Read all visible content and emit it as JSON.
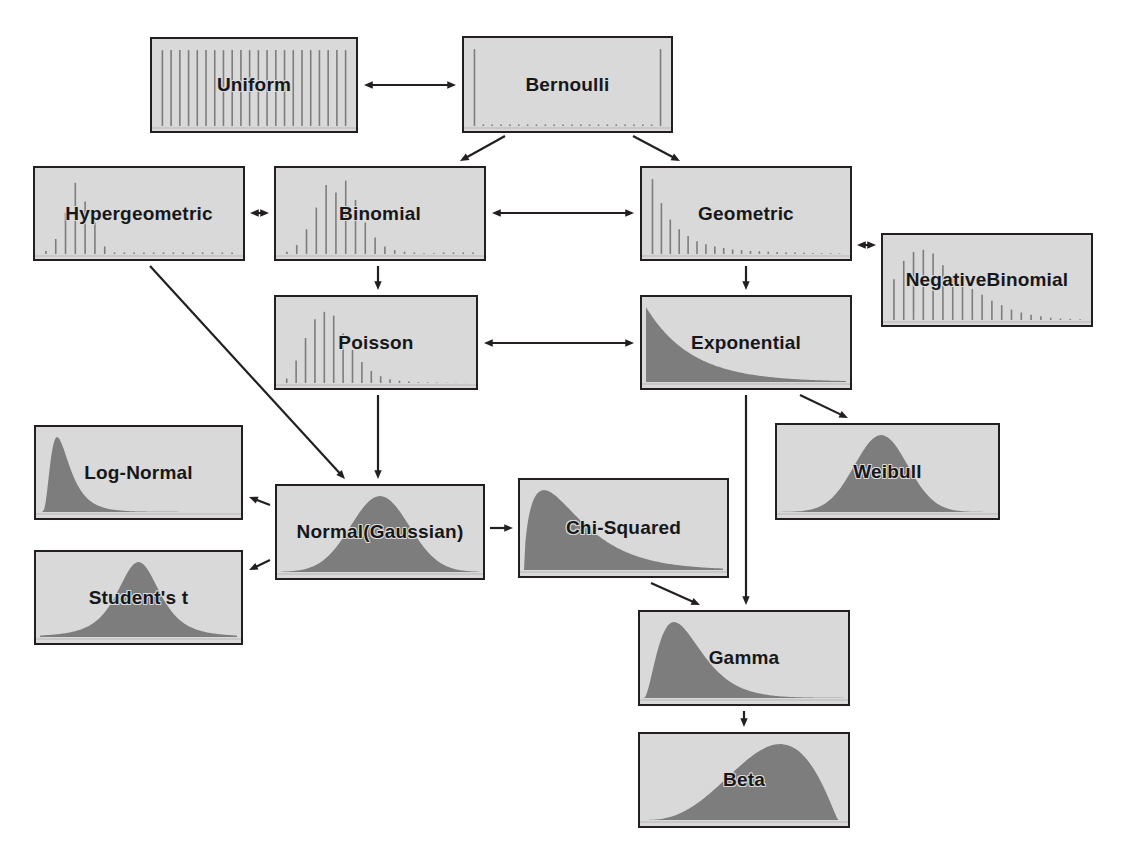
{
  "diagram": {
    "background_color": "#ffffff",
    "box_fill_color": "#d9d9d9",
    "box_border_color": "#231f20",
    "plot_fill_color": "#7d7d7d",
    "label_color": "#17171a"
  },
  "nodes": [
    {
      "id": "uniform",
      "label": "Uniform",
      "label_line2": "",
      "thumb": "discrete-uniform-pmf",
      "x": 150,
      "y": 37,
      "w": 208,
      "h": 96
    },
    {
      "id": "bernoulli",
      "label": "Bernoulli",
      "label_line2": "",
      "thumb": "bernoulli-pmf",
      "x": 462,
      "y": 36,
      "w": 211,
      "h": 97
    },
    {
      "id": "hypergeometric",
      "label": "Hypergeometric",
      "label_line2": "",
      "thumb": "hypergeometric-pmf",
      "x": 33,
      "y": 166,
      "w": 212,
      "h": 95
    },
    {
      "id": "binomial",
      "label": "Binomial",
      "label_line2": "",
      "thumb": "binomial-pmf",
      "x": 274,
      "y": 166,
      "w": 212,
      "h": 95
    },
    {
      "id": "geometric",
      "label": "Geometric",
      "label_line2": "",
      "thumb": "geometric-pmf",
      "x": 640,
      "y": 166,
      "w": 212,
      "h": 95
    },
    {
      "id": "negative-binomial",
      "label": "Negative",
      "label_line2": "Binomial",
      "thumb": "negative-binomial-pmf",
      "x": 881,
      "y": 233,
      "w": 212,
      "h": 94
    },
    {
      "id": "poisson",
      "label": "Poisson",
      "label_line2": "",
      "thumb": "poisson-pmf",
      "x": 274,
      "y": 295,
      "w": 204,
      "h": 95
    },
    {
      "id": "exponential",
      "label": "Exponential",
      "label_line2": "",
      "thumb": "exponential-pdf",
      "x": 640,
      "y": 295,
      "w": 212,
      "h": 95
    },
    {
      "id": "weibull",
      "label": "Weibull",
      "label_line2": "",
      "thumb": "weibull-pdf",
      "x": 775,
      "y": 423,
      "w": 225,
      "h": 97
    },
    {
      "id": "log-normal",
      "label": "Log-Normal",
      "label_line2": "",
      "thumb": "log-normal-pdf",
      "x": 34,
      "y": 425,
      "w": 209,
      "h": 95
    },
    {
      "id": "normal",
      "label": "Normal",
      "label_line2": "(Gaussian)",
      "thumb": "normal-pdf",
      "x": 275,
      "y": 484,
      "w": 210,
      "h": 96
    },
    {
      "id": "chi-squared",
      "label": "Chi-Squared",
      "label_line2": "",
      "thumb": "chi-squared-pdf",
      "x": 518,
      "y": 478,
      "w": 211,
      "h": 100
    },
    {
      "id": "students-t",
      "label": "Student's t",
      "label_line2": "",
      "thumb": "students-t-pdf",
      "x": 34,
      "y": 550,
      "w": 209,
      "h": 95
    },
    {
      "id": "gamma",
      "label": "Gamma",
      "label_line2": "",
      "thumb": "gamma-pdf",
      "x": 638,
      "y": 610,
      "w": 212,
      "h": 96
    },
    {
      "id": "beta",
      "label": "Beta",
      "label_line2": "",
      "thumb": "beta-pdf",
      "x": 638,
      "y": 732,
      "w": 212,
      "h": 96
    }
  ],
  "edges": [
    {
      "id": "uniform-bernoulli",
      "from": "uniform",
      "to": "bernoulli",
      "arrow": "double",
      "points": [
        [
          364,
          85
        ],
        [
          456,
          85
        ]
      ]
    },
    {
      "id": "bernoulli-binomial",
      "from": "bernoulli",
      "to": "binomial",
      "arrow": "single",
      "points": [
        [
          505,
          136
        ],
        [
          460,
          161
        ]
      ]
    },
    {
      "id": "bernoulli-geometric",
      "from": "bernoulli",
      "to": "geometric",
      "arrow": "single",
      "points": [
        [
          633,
          136
        ],
        [
          680,
          161
        ]
      ]
    },
    {
      "id": "hypergeometric-binomial",
      "from": "hypergeometric",
      "to": "binomial",
      "arrow": "double",
      "points": [
        [
          250,
          213
        ],
        [
          269,
          213
        ]
      ]
    },
    {
      "id": "binomial-geometric",
      "from": "binomial",
      "to": "geometric",
      "arrow": "double",
      "points": [
        [
          492,
          213
        ],
        [
          634,
          213
        ]
      ]
    },
    {
      "id": "geometric-negative-binomial",
      "from": "geometric",
      "to": "negative-binomial",
      "arrow": "double",
      "points": [
        [
          857,
          245
        ],
        [
          876,
          245
        ]
      ]
    },
    {
      "id": "binomial-poisson",
      "from": "binomial",
      "to": "poisson",
      "arrow": "single",
      "points": [
        [
          378,
          266
        ],
        [
          378,
          290
        ]
      ]
    },
    {
      "id": "geometric-exponential",
      "from": "geometric",
      "to": "exponential",
      "arrow": "single",
      "points": [
        [
          746,
          266
        ],
        [
          746,
          290
        ]
      ]
    },
    {
      "id": "poisson-exponential",
      "from": "poisson",
      "to": "exponential",
      "arrow": "double",
      "points": [
        [
          484,
          343
        ],
        [
          634,
          343
        ]
      ]
    },
    {
      "id": "hypergeometric-normal",
      "from": "hypergeometric",
      "to": "normal",
      "arrow": "single",
      "points": [
        [
          150,
          266
        ],
        [
          345,
          479
        ]
      ]
    },
    {
      "id": "poisson-normal",
      "from": "poisson",
      "to": "normal",
      "arrow": "single",
      "points": [
        [
          378,
          395
        ],
        [
          378,
          479
        ]
      ]
    },
    {
      "id": "normal-log-normal",
      "from": "normal",
      "to": "log-normal",
      "arrow": "single",
      "points": [
        [
          270,
          505
        ],
        [
          249,
          497
        ]
      ]
    },
    {
      "id": "normal-students-t",
      "from": "normal",
      "to": "students-t",
      "arrow": "single",
      "points": [
        [
          270,
          560
        ],
        [
          249,
          570
        ]
      ]
    },
    {
      "id": "normal-chi-squared",
      "from": "normal",
      "to": "chi-squared",
      "arrow": "single",
      "points": [
        [
          490,
          528
        ],
        [
          513,
          528
        ]
      ]
    },
    {
      "id": "exponential-weibull",
      "from": "exponential",
      "to": "weibull",
      "arrow": "single",
      "points": [
        [
          800,
          395
        ],
        [
          848,
          418
        ]
      ]
    },
    {
      "id": "exponential-gamma",
      "from": "exponential",
      "to": "gamma",
      "arrow": "single",
      "points": [
        [
          746,
          395
        ],
        [
          746,
          605
        ]
      ]
    },
    {
      "id": "chi-squared-gamma",
      "from": "chi-squared",
      "to": "gamma",
      "arrow": "single",
      "points": [
        [
          651,
          583
        ],
        [
          700,
          605
        ]
      ]
    },
    {
      "id": "gamma-beta",
      "from": "gamma",
      "to": "beta",
      "arrow": "single",
      "points": [
        [
          744,
          711
        ],
        [
          744,
          727
        ]
      ]
    }
  ],
  "chart_data": {
    "type": "diagram",
    "thumbnails": {
      "discrete-uniform-pmf": {
        "kind": "stems",
        "values": [
          1,
          1,
          1,
          1,
          1,
          1,
          1,
          1,
          1,
          1,
          1,
          1,
          1,
          1,
          1,
          1,
          1,
          1,
          1,
          1,
          1,
          1
        ]
      },
      "bernoulli-pmf": {
        "kind": "stems",
        "values": [
          1,
          0,
          0,
          0,
          0,
          0,
          0,
          0,
          0,
          0,
          0,
          0,
          0,
          0,
          0,
          0,
          0,
          0,
          0,
          0,
          0,
          1
        ]
      },
      "hypergeometric-pmf": {
        "kind": "stems",
        "values": [
          0.04,
          0.2,
          0.55,
          0.95,
          0.7,
          0.42,
          0.1,
          0.02,
          0,
          0,
          0,
          0,
          0,
          0,
          0,
          0,
          0,
          0,
          0,
          0
        ]
      },
      "binomial-pmf": {
        "kind": "stems",
        "values": [
          0.03,
          0.12,
          0.33,
          0.62,
          0.92,
          0.82,
          0.98,
          0.72,
          0.42,
          0.22,
          0.1,
          0.05,
          0.03,
          0.02,
          0.01,
          0.01,
          0,
          0,
          0,
          0
        ]
      },
      "geometric-pmf": {
        "kind": "stems",
        "values": [
          1,
          0.68,
          0.46,
          0.33,
          0.24,
          0.17,
          0.13,
          0.1,
          0.08,
          0.06,
          0.05,
          0.04,
          0.035,
          0.03,
          0.025,
          0.02,
          0.018,
          0.015,
          0.012,
          0.01,
          0.01,
          0.008
        ]
      },
      "negative-binomial-pmf": {
        "kind": "stems",
        "values": [
          0.55,
          0.8,
          0.92,
          0.95,
          0.9,
          0.74,
          0.6,
          0.5,
          0.42,
          0.34,
          0.26,
          0.2,
          0.14,
          0.1,
          0.07,
          0.05,
          0.03,
          0.02,
          0.015,
          0.01
        ]
      },
      "poisson-pmf": {
        "kind": "stems",
        "values": [
          0.06,
          0.3,
          0.6,
          0.85,
          0.95,
          0.9,
          0.66,
          0.44,
          0.28,
          0.16,
          0.09,
          0.05,
          0.03,
          0.02,
          0.01,
          0.008,
          0.005,
          0.004,
          0.003,
          0.002
        ]
      },
      "exponential-pdf": {
        "kind": "curve",
        "shape": "exponential-decay"
      },
      "weibull-pdf": {
        "kind": "curve",
        "shape": "bell-right"
      },
      "log-normal-pdf": {
        "kind": "curve",
        "shape": "lognormal"
      },
      "normal-pdf": {
        "kind": "curve",
        "shape": "bell"
      },
      "chi-squared-pdf": {
        "kind": "curve",
        "shape": "chi-squared"
      },
      "students-t-pdf": {
        "kind": "curve",
        "shape": "heavy-tailed-bell"
      },
      "gamma-pdf": {
        "kind": "curve",
        "shape": "gamma"
      },
      "beta-pdf": {
        "kind": "curve",
        "shape": "left-skew-beta"
      }
    }
  }
}
